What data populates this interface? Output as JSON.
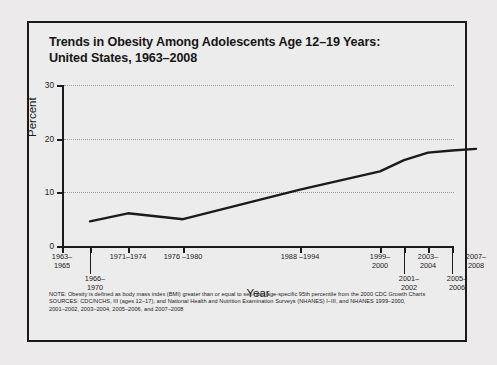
{
  "figure": {
    "title_line1": "Trends in Obesity Among Adolescents Age 12–19 Years:",
    "title_line2": "United States, 1963–2008"
  },
  "footnote": {
    "line1": "NOTE: Obesity is defined as body mass index (BMI) greater than or equal to sex- and age-specific 95th percentile from the 2000 CDC Growth Charts",
    "line2": "SOURCES: CDC/NCHS, III (ages 12–17), and National Health and Nutrition Examination Surveys (NHANES) I–III, and NHANES 1999–2000,",
    "line3": "2001–2002, 2003–2004, 2005–2006, and 2007–2008"
  },
  "chart_data": {
    "type": "line",
    "title": "Trends in Obesity Among Adolescents Age 12–19 Years: United States, 1963–2008",
    "xlabel": "Year",
    "ylabel": "Percent",
    "ylim": [
      0,
      30
    ],
    "yticks": [
      0,
      10,
      20,
      30
    ],
    "ytick_labels": [
      "0",
      "10",
      "20",
      "30"
    ],
    "grid": "horizontal-dotted",
    "legend": "none",
    "line_color": "#1b1b1b",
    "categories": [
      "1963–1965",
      "1966–1970",
      "1971–1974",
      "1976 –1980",
      "1988 –1994",
      "1999–2000",
      "2001–2002",
      "2003–2004",
      "2005–2006",
      "2007–2008"
    ],
    "category_labels": [
      {
        "text_line1": "1963–",
        "text_line2": "1965",
        "row": 0
      },
      {
        "text_line1": "1966–",
        "text_line2": "1970",
        "row": 1
      },
      {
        "text_line1": "1971–1974",
        "text_line2": "",
        "row": 0
      },
      {
        "text_line1": "1976 –1980",
        "text_line2": "",
        "row": 0
      },
      {
        "text_line1": "1988 –1994",
        "text_line2": "",
        "row": 0
      },
      {
        "text_line1": "1999–",
        "text_line2": "2000",
        "row": 0
      },
      {
        "text_line1": "2001–",
        "text_line2": "2002",
        "row": 1
      },
      {
        "text_line1": "2003–",
        "text_line2": "2004",
        "row": 0
      },
      {
        "text_line1": "2005–",
        "text_line2": "2006",
        "row": 1
      },
      {
        "text_line1": "2007–",
        "text_line2": "2008",
        "row": 0
      }
    ],
    "values": [
      null,
      4.6,
      6.1,
      5.0,
      10.5,
      13.9,
      16.0,
      17.4,
      17.8,
      18.1
    ],
    "series": [
      {
        "name": "Obesity percent, adolescents 12–19 years",
        "points": [
          {
            "x": "1966–1970",
            "y": 4.6
          },
          {
            "x": "1971–1974",
            "y": 6.1
          },
          {
            "x": "1976 –1980",
            "y": 5.0
          },
          {
            "x": "1988 –1994",
            "y": 10.5
          },
          {
            "x": "1999–2000",
            "y": 13.9
          },
          {
            "x": "2001–2002",
            "y": 16.0
          },
          {
            "x": "2003–2004",
            "y": 17.4
          },
          {
            "x": "2005–2006",
            "y": 17.8
          },
          {
            "x": "2007–2008",
            "y": 18.1
          }
        ]
      }
    ]
  }
}
